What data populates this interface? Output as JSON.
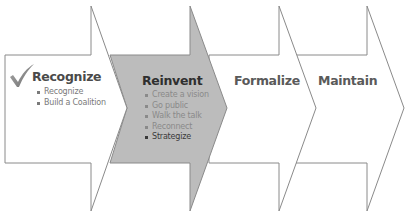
{
  "diagram": {
    "type": "chevron-process",
    "colors": {
      "outline": "#8a8a8a",
      "active_fill": "#bcbcbc",
      "inactive_fill": "#ffffff",
      "title_active": "#2f2f2f",
      "title_inactive": "#5a5a5a",
      "bullet_text": "#7a7a7a",
      "bullet_text_on_active": "#8a8a8a",
      "bullet_emphasis": "#3a3a3a",
      "check_icon": "#7d7d7d"
    },
    "stages": [
      {
        "title": "Recognize",
        "completed": true,
        "icon": "checkmark-icon",
        "bullets": [
          "Recognize",
          "Build a Coalition"
        ]
      },
      {
        "title": "Reinvent",
        "active": true,
        "bullets": [
          "Create a vision",
          "Go public",
          "Walk the talk",
          "Reconnect",
          "Strategize"
        ],
        "emphasized_bullet": "Strategize"
      },
      {
        "title": "Formalize",
        "bullets": []
      },
      {
        "title": "Maintain",
        "bullets": []
      }
    ]
  }
}
